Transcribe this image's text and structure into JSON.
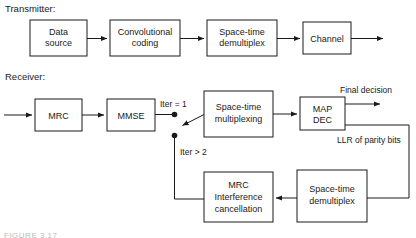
{
  "figure": {
    "sections": {
      "transmitter_label": "Transmitter:",
      "receiver_label": "Receiver:"
    },
    "caption": "FIGURE 3.17",
    "colors": {
      "line": "#1a1a1a",
      "box_fill": "#ffffff",
      "background": "#ffffff",
      "caption": "#b9b9b9"
    },
    "transmitter": {
      "blocks": [
        {
          "id": "data-source",
          "line1": "Data",
          "line2": "source"
        },
        {
          "id": "convolutional-coding",
          "line1": "Convolutional",
          "line2": "coding"
        },
        {
          "id": "space-time-demultiplex-tx",
          "line1": "Space-time",
          "line2": "demultiplex"
        },
        {
          "id": "channel",
          "line1": "Channel",
          "line2": ""
        }
      ]
    },
    "receiver": {
      "blocks": [
        {
          "id": "mrc",
          "line1": "MRC",
          "line2": "",
          "line3": ""
        },
        {
          "id": "mmse",
          "line1": "MMSE",
          "line2": "",
          "line3": ""
        },
        {
          "id": "space-time-multiplexing",
          "line1": "Space-time",
          "line2": "multiplexing",
          "line3": ""
        },
        {
          "id": "map-dec",
          "line1": "MAP",
          "line2": "DEC",
          "line3": ""
        },
        {
          "id": "mrc-interference-cancellation",
          "line1": "MRC",
          "line2": "Interference",
          "line3": "cancellation"
        },
        {
          "id": "space-time-demultiplex-rx",
          "line1": "Space-time",
          "line2": "demultiplex",
          "line3": ""
        }
      ],
      "wire_labels": {
        "iter_eq_1": "Iter = 1",
        "iter_gt_2": "Iter > 2",
        "final_decision": "Final decision",
        "llr_of_parity_bits": "LLR of parity bits"
      }
    }
  }
}
